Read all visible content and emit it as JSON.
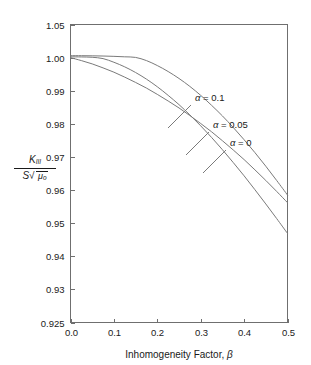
{
  "chart_data": {
    "type": "line",
    "title": "",
    "subtitle": "",
    "xlabel_text": "Inhomogeneity Factor,",
    "xlabel_symbol": "β",
    "ylabel_numerator": "K",
    "ylabel_numerator_sub": "III",
    "ylabel_denominator_lead": "S",
    "ylabel_denominator_radicand": "μ",
    "ylabel_denominator_radicand_sub": "o",
    "xlim": [
      0.0,
      0.5
    ],
    "ylim": [
      0.925,
      1.05
    ],
    "grid": false,
    "legend_position": "inline-annotations",
    "x_ticks": [
      "0.0",
      "0.1",
      "0.2",
      "0.3",
      "0.4",
      "0.5"
    ],
    "x_tick_values": [
      0.0,
      0.1,
      0.2,
      0.3,
      0.4,
      0.5
    ],
    "y_ticks": [
      "0.925",
      "0.93",
      "0.94",
      "0.95",
      "0.96",
      "0.97",
      "0.98",
      "0.99",
      "1.00",
      "1.05"
    ],
    "y_tick_values": [
      0.925,
      0.93,
      0.94,
      0.95,
      0.96,
      0.97,
      0.98,
      0.99,
      1.0,
      1.05
    ],
    "y_axis_scale_note": "piecewise: equal pixel spacing between consecutive listed ticks",
    "curve_color": "#7a7a7a",
    "axis_color": "#6f6f6f",
    "series": [
      {
        "name": "α = 0.1",
        "alpha": 0.1,
        "label": "α = 0.1",
        "x": [
          0.0,
          0.025,
          0.05,
          0.075,
          0.1,
          0.125,
          0.15,
          0.175,
          0.2,
          0.225,
          0.25,
          0.275,
          0.3,
          0.325,
          0.35,
          0.375,
          0.4,
          0.425,
          0.45,
          0.475,
          0.5
        ],
        "values": [
          1.0029,
          1.0029,
          1.0027,
          1.0024,
          1.0019,
          1.0012,
          1.0003,
          0.9991,
          0.9976,
          0.9958,
          0.9937,
          0.9913,
          0.9886,
          0.9856,
          0.9824,
          0.9789,
          0.9752,
          0.9713,
          0.9672,
          0.9629,
          0.9585
        ]
      },
      {
        "name": "α = 0.05",
        "alpha": 0.05,
        "label": "α = 0.05",
        "x": [
          0.0,
          0.025,
          0.05,
          0.075,
          0.1,
          0.125,
          0.15,
          0.175,
          0.2,
          0.225,
          0.25,
          0.275,
          0.3,
          0.325,
          0.35,
          0.375,
          0.4,
          0.425,
          0.45,
          0.475,
          0.5
        ],
        "values": [
          1.0012,
          1.001,
          1.0005,
          0.9997,
          0.9986,
          0.9972,
          0.9955,
          0.9935,
          0.9912,
          0.9886,
          0.9858,
          0.9827,
          0.9794,
          0.9759,
          0.9722,
          0.9683,
          0.9643,
          0.9601,
          0.9558,
          0.9514,
          0.9469
        ]
      },
      {
        "name": "α = 0",
        "alpha": 0,
        "label": "α = 0",
        "x": [
          0.0,
          0.025,
          0.05,
          0.075,
          0.1,
          0.125,
          0.15,
          0.175,
          0.2,
          0.225,
          0.25,
          0.275,
          0.3,
          0.325,
          0.35,
          0.375,
          0.4,
          0.425,
          0.45,
          0.475,
          0.5
        ],
        "values": [
          1.0,
          0.9991,
          0.9981,
          0.9969,
          0.9956,
          0.9941,
          0.9925,
          0.9908,
          0.9889,
          0.9869,
          0.9848,
          0.9825,
          0.9801,
          0.9776,
          0.9749,
          0.9721,
          0.9692,
          0.9661,
          0.9629,
          0.9596,
          0.9562
        ]
      }
    ],
    "annotations": [
      {
        "text": "α = 0.1",
        "label_x": 195,
        "label_y": 101,
        "leader_from_x": 191,
        "leader_from_y": 105,
        "leader_to_x": 168,
        "leader_to_y": 128
      },
      {
        "text": "α = 0.05",
        "label_x": 213,
        "label_y": 128,
        "leader_from_x": 209,
        "leader_from_y": 132,
        "leader_to_x": 186,
        "leader_to_y": 155
      },
      {
        "text": "α = 0",
        "label_x": 230,
        "label_y": 146,
        "leader_from_x": 226,
        "leader_from_y": 150,
        "leader_to_x": 203,
        "leader_to_y": 173
      }
    ]
  }
}
